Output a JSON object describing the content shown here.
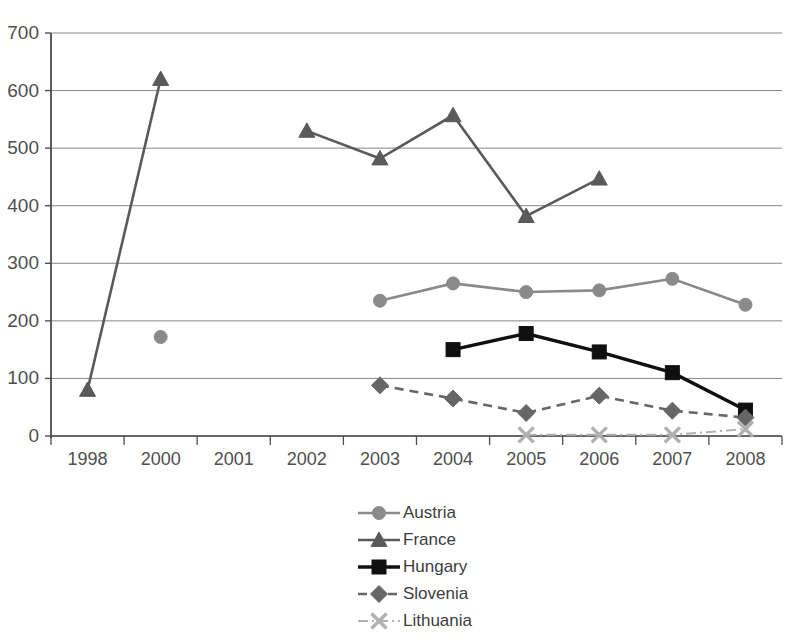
{
  "title": "1998–2008",
  "chart_data": {
    "type": "line",
    "title": "1998–2008",
    "xlabel": "",
    "ylabel": "",
    "ylim": [
      0,
      700
    ],
    "ytick_step": 100,
    "yticks": [
      0,
      100,
      200,
      300,
      400,
      500,
      600,
      700
    ],
    "grid": true,
    "legend_position": "bottom-center",
    "categories": [
      "1998",
      "2000",
      "2001",
      "2002",
      "2003",
      "2004",
      "2005",
      "2006",
      "2007",
      "2008"
    ],
    "series": [
      {
        "name": "Austria",
        "color": "#8a8a8a",
        "marker": "circle",
        "linestyle": "solid",
        "values": [
          null,
          172,
          null,
          null,
          235,
          265,
          250,
          253,
          273,
          228
        ]
      },
      {
        "name": "France",
        "color": "#5a5a5a",
        "marker": "triangle",
        "linestyle": "solid",
        "values": [
          80,
          620,
          null,
          530,
          482,
          557,
          382,
          447,
          null,
          null
        ]
      },
      {
        "name": "Hungary",
        "color": "#101010",
        "marker": "square",
        "linestyle": "solid",
        "values": [
          null,
          null,
          null,
          null,
          null,
          150,
          178,
          146,
          110,
          45
        ]
      },
      {
        "name": "Slovenia",
        "color": "#666666",
        "marker": "diamond",
        "linestyle": "dashed",
        "values": [
          null,
          null,
          null,
          null,
          88,
          65,
          40,
          70,
          44,
          32
        ]
      },
      {
        "name": "Lithuania",
        "color": "#b0b0b0",
        "marker": "x",
        "linestyle": "dashdot",
        "values": [
          null,
          null,
          null,
          null,
          null,
          null,
          2,
          2,
          2,
          12
        ]
      }
    ]
  }
}
